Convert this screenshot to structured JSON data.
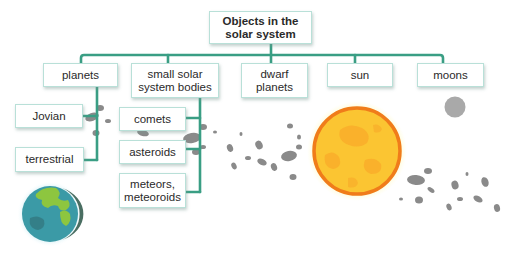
{
  "diagram": {
    "root": {
      "label": "Objects in the\nsolar system"
    },
    "categories": [
      {
        "id": "planets",
        "label": "planets"
      },
      {
        "id": "small-bodies",
        "label": "small solar\nsystem bodies"
      },
      {
        "id": "dwarf-planets",
        "label": "dwarf\nplanets"
      },
      {
        "id": "sun",
        "label": "sun"
      },
      {
        "id": "moons",
        "label": "moons"
      }
    ],
    "planet_types": [
      {
        "label": "Jovian"
      },
      {
        "label": "terrestrial"
      }
    ],
    "small_body_types": [
      {
        "label": "comets"
      },
      {
        "label": "asteroids"
      },
      {
        "label": "meteors,\nmeteoroids"
      }
    ]
  },
  "illustrations": [
    {
      "name": "earth-icon",
      "description": "Earth"
    },
    {
      "name": "sun-icon",
      "description": "Sun"
    },
    {
      "name": "moon-icon",
      "description": "Moon"
    },
    {
      "name": "asteroid-belt-icon",
      "description": "asteroids"
    }
  ],
  "colors": {
    "connector": "#3a9e84",
    "box_border": "#b9e0d8",
    "sun_outer": "#f07c1a",
    "sun_fill": "#fbc532",
    "earth_ocean": "#3b9aa6",
    "earth_land": "#8dc63f",
    "rock": "#8a8a8a"
  }
}
